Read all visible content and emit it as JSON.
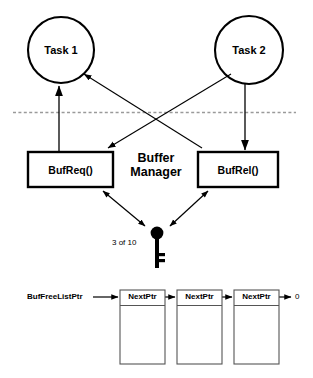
{
  "diagram": {
    "tasks": [
      {
        "name": "task-1",
        "label": "Task 1",
        "cx": 61,
        "cy": 50,
        "r": 33
      },
      {
        "name": "task-2",
        "label": "Task 2",
        "cx": 249,
        "cy": 50,
        "r": 34
      }
    ],
    "divider": {
      "name": "kernel-boundary",
      "y": 112,
      "x1": 13,
      "x2": 296,
      "style": "dashed",
      "color": "#9a9a9a"
    },
    "functions": [
      {
        "name": "bufreq-box",
        "label": "BufReq()",
        "x": 28,
        "y": 152,
        "w": 85,
        "h": 35
      },
      {
        "name": "bufrel-box",
        "label": "BufRel()",
        "x": 198,
        "y": 152,
        "w": 80,
        "h": 35
      }
    ],
    "manager": {
      "label_line1": "Buffer",
      "label_line2": "Manager",
      "cx": 156,
      "cy": 170
    },
    "semaphore": {
      "icon": "key-icon",
      "count_label": "3 of 10",
      "count_available": 3,
      "count_total": 10,
      "cx": 157,
      "head_cy": 233
    },
    "freelist": {
      "head_pointer_label": "BufFreeListPtr",
      "terminator_label": "0",
      "node_field_label": "NextPtr",
      "nodes": [
        {
          "name": "buffer-node-1",
          "label": "NextPtr",
          "x": 120,
          "y": 290,
          "w": 45,
          "h": 74
        },
        {
          "name": "buffer-node-2",
          "label": "NextPtr",
          "x": 177,
          "y": 290,
          "w": 45,
          "h": 74
        },
        {
          "name": "buffer-node-3",
          "label": "NextPtr",
          "x": 234,
          "y": 290,
          "w": 45,
          "h": 74
        }
      ]
    },
    "colors": {
      "stroke": "#000000",
      "fill": "#ffffff",
      "divider": "#9a9a9a",
      "node_border": "#555555"
    }
  }
}
